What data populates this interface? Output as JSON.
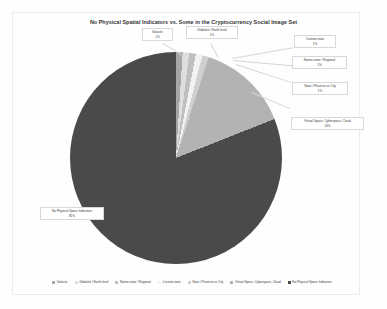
{
  "chart_data": {
    "type": "pie",
    "title": "No Physical Spatial Indicators vs. Some in the Cryptocurrency Social Image Set",
    "categories": [
      "Galactic",
      "Globalist / Earth-level",
      "Nation-state / Regional",
      "Custom-state",
      "State / Province or City",
      "Virtual Space, Cyberspace, Cloud",
      "No Physical Space Indicators"
    ],
    "values": [
      1,
      1,
      1,
      1,
      1,
      14,
      81
    ],
    "value_labels": [
      "1%",
      "1%",
      "1%",
      "1%",
      "1%",
      "14%",
      "81%"
    ],
    "colors": [
      "#a6a6a6",
      "#dedede",
      "#bfbfbf",
      "#f2f2f2",
      "#d0d0d0",
      "#b3b3b3",
      "#4a4a4a"
    ],
    "legend_position": "bottom",
    "grid": false,
    "xlabel": "",
    "ylabel": ""
  },
  "callouts": [
    {
      "label": "Galactic",
      "pct": "1%"
    },
    {
      "label": "Globalist / Earth-level",
      "pct": "1%"
    },
    {
      "label": "Custom-state",
      "pct": "1%"
    },
    {
      "label": "Nation-state / Regional",
      "pct": "1%"
    },
    {
      "label": "State / Province or City",
      "pct": "1%"
    },
    {
      "label": "Virtual Space, Cyberspace, Cloud",
      "pct": "14%"
    },
    {
      "label": "No Physical Space Indicators",
      "pct": "81%"
    }
  ]
}
